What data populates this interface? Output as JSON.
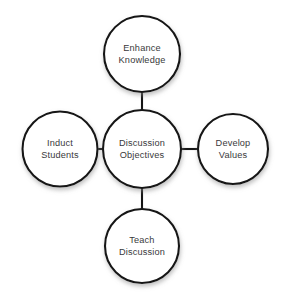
{
  "diagram": {
    "type": "radial-hub-and-spoke",
    "background_color": "#ffffff",
    "stroke_color": "#141414",
    "text_color": "#39393b",
    "center": {
      "id": "discussion-objectives",
      "line1": "Discussion",
      "line2": "Objectives",
      "cx": 142,
      "cy": 149,
      "r": 39
    },
    "nodes": [
      {
        "id": "enhance-knowledge",
        "position": "top",
        "line1": "Enhance",
        "line2": "Knowledge",
        "cx": 142,
        "cy": 54,
        "r": 38
      },
      {
        "id": "develop-values",
        "position": "right",
        "line1": "Develop",
        "line2": "Values",
        "cx": 233,
        "cy": 149,
        "r": 35
      },
      {
        "id": "teach-discussion",
        "position": "bottom",
        "line1": "Teach",
        "line2": "Discussion",
        "cx": 142,
        "cy": 246,
        "r": 37
      },
      {
        "id": "induct-students",
        "position": "left",
        "line1": "Induct",
        "line2": "Students",
        "cx": 60,
        "cy": 149,
        "r": 37.5
      }
    ],
    "connectors": [
      {
        "id": "center-to-top",
        "x1": 142,
        "y1": 110,
        "x2": 142,
        "y2": 92
      },
      {
        "id": "center-to-right",
        "x1": 181,
        "y1": 149,
        "x2": 198,
        "y2": 149
      },
      {
        "id": "center-to-bottom",
        "x1": 142,
        "y1": 188,
        "x2": 142,
        "y2": 209
      },
      {
        "id": "center-to-left",
        "x1": 103,
        "y1": 149,
        "x2": 97,
        "y2": 149
      }
    ]
  }
}
